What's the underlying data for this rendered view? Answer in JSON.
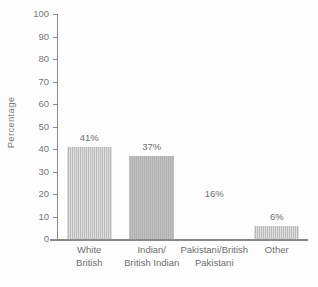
{
  "chart_data": {
    "type": "bar",
    "title": "",
    "subtitle": "",
    "xlabel": "",
    "ylabel": "Percentage",
    "ylim": [
      0,
      100
    ],
    "ytick_step": 10,
    "yticks": [
      100,
      90,
      80,
      70,
      60,
      50,
      40,
      30,
      20,
      10,
      0
    ],
    "ytick_labels": [
      "100",
      "90",
      "80",
      "70",
      "60",
      "50",
      "40",
      "30",
      "20",
      "10",
      "0"
    ],
    "grid": false,
    "legend": null,
    "legend_position": "none",
    "categories": [
      "White British",
      "Indian/ British Indian",
      "Pakistani/British Pakistani",
      "Other"
    ],
    "category_lines": [
      [
        "White",
        "British"
      ],
      [
        "Indian/",
        "British Indian"
      ],
      [
        "Pakistani/British",
        "Pakistani"
      ],
      [
        "Other",
        ""
      ]
    ],
    "values": [
      41,
      37,
      16,
      6
    ],
    "data_labels": [
      "41%",
      "37%",
      "16%",
      "6%"
    ],
    "bar_rendered": [
      true,
      true,
      false,
      true
    ],
    "colors": {
      "bar_fill": "#b9b9b9",
      "bar_fill_solid": "#b2b2b2",
      "axis": "#8a8a8a",
      "text": "#6d6d6d",
      "background": "#fdfdfd"
    }
  }
}
